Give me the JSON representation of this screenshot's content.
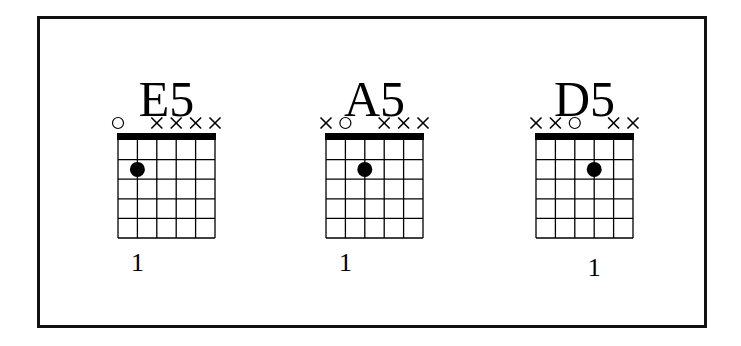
{
  "chart_data": {
    "type": "chord_diagrams",
    "strings": 6,
    "frets_shown": 5,
    "colors": {
      "ink": "#000000",
      "background": "#ffffff"
    },
    "chords": [
      {
        "name": "E5",
        "open_muted": [
          "o",
          "",
          "x",
          "x",
          "x",
          "x"
        ],
        "dots": [
          {
            "string": 2,
            "fret": 2
          }
        ],
        "fingers": [
          {
            "string": 2,
            "label": "1"
          }
        ]
      },
      {
        "name": "A5",
        "open_muted": [
          "x",
          "o",
          "",
          "x",
          "x",
          "x"
        ],
        "dots": [
          {
            "string": 3,
            "fret": 2
          }
        ],
        "fingers": [
          {
            "string": 2,
            "label": "1"
          }
        ]
      },
      {
        "name": "D5",
        "open_muted": [
          "x",
          "x",
          "o",
          "",
          "x",
          "x"
        ],
        "dots": [
          {
            "string": 4,
            "fret": 2
          }
        ],
        "fingers": [
          {
            "string": 4,
            "label": "1"
          }
        ]
      }
    ]
  }
}
